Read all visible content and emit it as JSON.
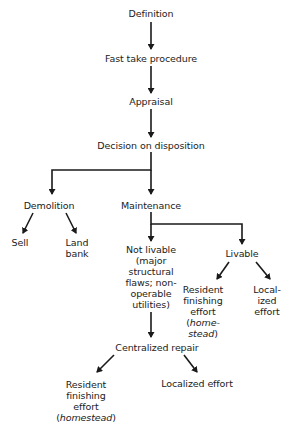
{
  "nodes": {
    "definition": "Definition",
    "fast_take": "Fast take procedure",
    "appraisal": "Appraisal",
    "decision": "Decision on disposition",
    "demolition": "Demolition",
    "maintenance": "Maintenance",
    "sell": "Sell",
    "land_bank": [
      "Land",
      "bank"
    ],
    "not_livable": [
      "Not livable",
      "(major",
      "structural",
      "flaws; non-",
      "operable",
      "utilities)"
    ],
    "livable": "Livable",
    "livable_resident": [
      "Resident",
      "finishing",
      "effort",
      "(",
      "home-",
      "stead",
      ")"
    ],
    "livable_localized": [
      "Local-",
      "ized",
      "effort"
    ],
    "centralized_repair": "Centralized repair",
    "bottom_resident": [
      "Resident",
      "finishing",
      "effort",
      "(",
      "homestead",
      ")"
    ],
    "bottom_localized": "Localized effort"
  },
  "colors": {
    "line": "#1a1a1a",
    "text": "#222222",
    "background": "#ffffff"
  }
}
